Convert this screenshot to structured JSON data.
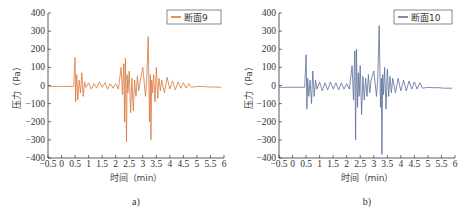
{
  "chart_data": [
    {
      "type": "line",
      "panel_label": "a)",
      "title": "",
      "xlabel": "时间（min）",
      "ylabel": "压力（Pa）",
      "xlim": [
        -0.5,
        6
      ],
      "ylim": [
        -400,
        400
      ],
      "x_ticks": [
        "-0.5",
        "0",
        "0.5",
        "1",
        "1.5",
        "2",
        "2.5",
        "3",
        "3.5",
        "4",
        "4.5",
        "5",
        "5.5",
        "6"
      ],
      "y_ticks": [
        "400",
        "300",
        "200",
        "100",
        "0",
        "-100",
        "-200",
        "-300",
        "-400"
      ],
      "grid": false,
      "legend_position": "upper right",
      "series": [
        {
          "name": "断面9",
          "color": "#d9773a",
          "x": [
            -0.5,
            0.0,
            0.45,
            0.5,
            0.52,
            0.56,
            0.6,
            0.65,
            0.7,
            0.75,
            0.8,
            0.85,
            0.9,
            1.0,
            1.1,
            1.2,
            1.3,
            1.4,
            1.5,
            1.6,
            1.7,
            1.8,
            1.9,
            2.0,
            2.1,
            2.2,
            2.25,
            2.3,
            2.33,
            2.36,
            2.4,
            2.42,
            2.45,
            2.5,
            2.55,
            2.6,
            2.65,
            2.7,
            2.75,
            2.8,
            2.85,
            2.9,
            3.0,
            3.1,
            3.15,
            3.2,
            3.25,
            3.28,
            3.3,
            3.33,
            3.36,
            3.4,
            3.45,
            3.5,
            3.55,
            3.6,
            3.65,
            3.7,
            3.8,
            3.9,
            4.0,
            4.1,
            4.2,
            4.3,
            4.4,
            4.5,
            4.6,
            4.7,
            4.8,
            5.0,
            5.2,
            5.4,
            5.6,
            5.9
          ],
          "values": [
            -5,
            -5,
            -5,
            155,
            -90,
            60,
            -80,
            30,
            -40,
            70,
            -60,
            20,
            -10,
            15,
            -20,
            10,
            -15,
            20,
            -10,
            15,
            -20,
            10,
            -15,
            10,
            -20,
            100,
            -50,
            120,
            -200,
            150,
            -310,
            60,
            -40,
            80,
            -150,
            40,
            -140,
            30,
            -60,
            50,
            -30,
            20,
            100,
            -60,
            40,
            270,
            -200,
            60,
            -300,
            30,
            -40,
            60,
            -90,
            100,
            -70,
            40,
            -30,
            30,
            -40,
            45,
            -20,
            25,
            -25,
            20,
            -15,
            15,
            -15,
            10,
            -10,
            -5,
            -5,
            -8,
            -8,
            -10
          ]
        }
      ]
    },
    {
      "type": "line",
      "panel_label": "b)",
      "title": "",
      "xlabel": "时间（min）",
      "ylabel": "压力（Pa）",
      "xlim": [
        -0.5,
        6
      ],
      "ylim": [
        -400,
        400
      ],
      "x_ticks": [
        "-0.5",
        "0",
        "0.5",
        "1",
        "1.5",
        "2",
        "2.5",
        "3",
        "3.5",
        "4",
        "4.5",
        "5",
        "5.5",
        "6"
      ],
      "y_ticks": [
        "400",
        "300",
        "200",
        "100",
        "0",
        "-100",
        "-200",
        "-300",
        "-400"
      ],
      "grid": false,
      "legend_position": "upper right",
      "series": [
        {
          "name": "断面10",
          "color": "#5a6f99",
          "x": [
            -0.5,
            0.0,
            0.45,
            0.5,
            0.53,
            0.56,
            0.6,
            0.65,
            0.7,
            0.75,
            0.8,
            0.85,
            0.9,
            1.0,
            1.1,
            1.2,
            1.3,
            1.4,
            1.5,
            1.6,
            1.7,
            1.8,
            1.9,
            2.0,
            2.1,
            2.2,
            2.25,
            2.3,
            2.33,
            2.36,
            2.4,
            2.43,
            2.46,
            2.5,
            2.55,
            2.6,
            2.65,
            2.7,
            2.75,
            2.8,
            2.85,
            2.9,
            3.0,
            3.1,
            3.15,
            3.2,
            3.25,
            3.28,
            3.3,
            3.33,
            3.36,
            3.4,
            3.45,
            3.5,
            3.55,
            3.6,
            3.65,
            3.7,
            3.8,
            3.9,
            4.0,
            4.1,
            4.2,
            4.3,
            4.4,
            4.5,
            4.6,
            4.7,
            4.8,
            5.0,
            5.2,
            5.4,
            5.6,
            5.9
          ],
          "values": [
            -10,
            -10,
            -10,
            170,
            -130,
            40,
            -60,
            30,
            -100,
            80,
            -60,
            30,
            -20,
            20,
            -30,
            15,
            -25,
            20,
            -20,
            15,
            -25,
            15,
            -20,
            10,
            -20,
            110,
            -80,
            190,
            -300,
            200,
            -120,
            70,
            -60,
            110,
            -160,
            50,
            -80,
            40,
            -60,
            60,
            -40,
            30,
            80,
            -60,
            50,
            330,
            -120,
            40,
            -380,
            60,
            -50,
            100,
            -130,
            90,
            -60,
            50,
            -40,
            40,
            -40,
            40,
            -30,
            30,
            -30,
            25,
            -20,
            20,
            -20,
            15,
            -15,
            -10,
            -12,
            -12,
            -15,
            -15
          ]
        }
      ]
    }
  ],
  "panels": [
    {
      "label": "a)",
      "legend": "断面9",
      "xlabel": "时间（min）",
      "ylabel": "压力（Pa）"
    },
    {
      "label": "b)",
      "legend": "断面10",
      "xlabel": "时间（min）",
      "ylabel": "压力（Pa）"
    }
  ]
}
